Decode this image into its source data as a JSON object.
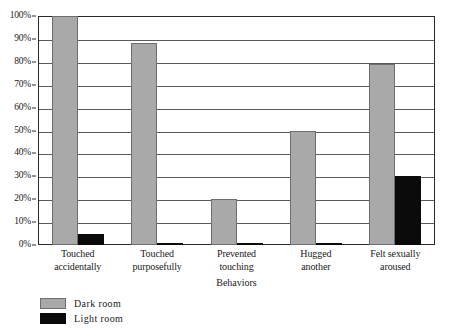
{
  "chart_data": {
    "type": "bar",
    "title": "",
    "xlabel": "Behaviors",
    "ylabel": "",
    "categories": [
      "Touched accidentally",
      "Touched purposefully",
      "Prevented touching",
      "Hugged another",
      "Felt sexually aroused"
    ],
    "category_lines": [
      [
        "Touched",
        "accidentally"
      ],
      [
        "Touched",
        "purposefully"
      ],
      [
        "Prevented",
        "touching"
      ],
      [
        "Hugged",
        "another"
      ],
      [
        "Felt sexually",
        "aroused"
      ]
    ],
    "series": [
      {
        "name": "Dark room",
        "color": "#a9a9a9",
        "values": [
          100,
          88,
          20,
          50,
          79
        ]
      },
      {
        "name": "Light room",
        "color": "#0a0a0a",
        "values": [
          5,
          1,
          1,
          1,
          30
        ]
      }
    ],
    "ylim": [
      0,
      100
    ],
    "yticks": [
      0,
      10,
      20,
      30,
      40,
      50,
      60,
      70,
      80,
      90,
      100
    ],
    "ytick_labels": [
      "0%",
      "10%",
      "20%",
      "30%",
      "40%",
      "50%",
      "60%",
      "70%",
      "80%",
      "90%",
      "100%"
    ],
    "grid": true,
    "grid_axis": "y",
    "legend_position": "bottom-left"
  },
  "legend": {
    "entries": [
      {
        "label": "Dark room",
        "color": "#a9a9a9"
      },
      {
        "label": "Light room",
        "color": "#0a0a0a"
      }
    ]
  },
  "caption": {
    "text": ""
  }
}
